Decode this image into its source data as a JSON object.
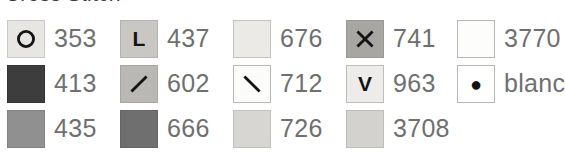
{
  "title": "Cross Stitch",
  "legend": {
    "columns": 5,
    "rows": 3,
    "entries": [
      {
        "code": "353",
        "symbol": "O",
        "symbol_name": "letter-o-symbol",
        "color": "#e8e6e3",
        "border": "#c9c9c9"
      },
      {
        "code": "437",
        "symbol": "L",
        "symbol_name": "letter-l-symbol",
        "color": "#c9c7c4",
        "border": "#b5b3b0"
      },
      {
        "code": "676",
        "symbol": "",
        "symbol_name": "no-symbol",
        "color": "#eceae7",
        "border": "#c4c2bf"
      },
      {
        "code": "741",
        "symbol": "X",
        "symbol_name": "letter-x-symbol",
        "color": "#a8a6a3",
        "border": "#9a9895"
      },
      {
        "code": "3770",
        "symbol": "",
        "symbol_name": "no-symbol",
        "color": "#fdfdfc",
        "border": "#b9b7b4"
      },
      {
        "code": "413",
        "symbol": "",
        "symbol_name": "no-symbol",
        "color": "#3d3d3d",
        "border": "#333333"
      },
      {
        "code": "602",
        "symbol": "/",
        "symbol_name": "forward-slash-symbol",
        "color": "#bab8b5",
        "border": "#a8a6a3"
      },
      {
        "code": "712",
        "symbol": "\\",
        "symbol_name": "backslash-symbol",
        "color": "#fbfbfa",
        "border": "#b9b7b4"
      },
      {
        "code": "963",
        "symbol": "V",
        "symbol_name": "letter-v-symbol",
        "color": "#eeecea",
        "border": "#bfbdba"
      },
      {
        "code": "blanc",
        "symbol": "●",
        "symbol_name": "filled-dot-symbol",
        "color": "#ffffff",
        "border": "#b9b7b4"
      },
      {
        "code": "435",
        "symbol": "",
        "symbol_name": "no-symbol",
        "color": "#919090",
        "border": "#848383"
      },
      {
        "code": "666",
        "symbol": "",
        "symbol_name": "no-symbol",
        "color": "#6f6f6f",
        "border": "#646464"
      },
      {
        "code": "726",
        "symbol": "",
        "symbol_name": "no-symbol",
        "color": "#d8d6d3",
        "border": "#c2c0bd"
      },
      {
        "code": "3708",
        "symbol": "",
        "symbol_name": "no-symbol",
        "color": "#d4d2cf",
        "border": "#bebcb9"
      },
      {
        "code": "",
        "symbol": "",
        "symbol_name": "no-symbol",
        "color": "",
        "border": "",
        "empty": true
      }
    ]
  }
}
